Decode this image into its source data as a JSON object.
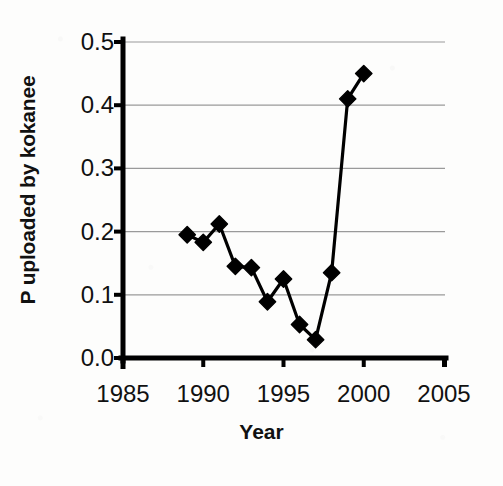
{
  "chart_data": {
    "type": "line",
    "title": "",
    "xlabel": "Year",
    "ylabel": "P uploaded by kokanee",
    "xlim": [
      1985,
      2005
    ],
    "ylim": [
      0.0,
      0.5
    ],
    "xticks": [
      1985,
      1990,
      1995,
      2000,
      2005
    ],
    "xtick_labels": [
      "1985",
      "1990",
      "1995",
      "2000",
      "2005"
    ],
    "yticks": [
      0.0,
      0.1,
      0.2,
      0.3,
      0.4,
      0.5
    ],
    "ytick_labels": [
      "0.0",
      "0.1",
      "0.2",
      "0.3",
      "0.4",
      "0.5"
    ],
    "grid": "horizontal",
    "legend": "none",
    "marker": "filled-diamond",
    "line_color": "#000000",
    "marker_color": "#000000",
    "grid_color": "#9a9a9a",
    "axis_color": "#000000",
    "x": [
      1989,
      1990,
      1991,
      1992,
      1993,
      1994,
      1995,
      1996,
      1997,
      1998,
      1999,
      2000
    ],
    "values": [
      0.195,
      0.183,
      0.212,
      0.145,
      0.143,
      0.089,
      0.125,
      0.053,
      0.029,
      0.135,
      0.41,
      0.45
    ],
    "series": [
      {
        "name": "P uploaded by kokanee",
        "x": [
          1989,
          1990,
          1991,
          1992,
          1993,
          1994,
          1995,
          1996,
          1997,
          1998,
          1999,
          2000
        ],
        "values": [
          0.195,
          0.183,
          0.212,
          0.145,
          0.143,
          0.089,
          0.125,
          0.053,
          0.029,
          0.135,
          0.41,
          0.45
        ]
      }
    ]
  }
}
